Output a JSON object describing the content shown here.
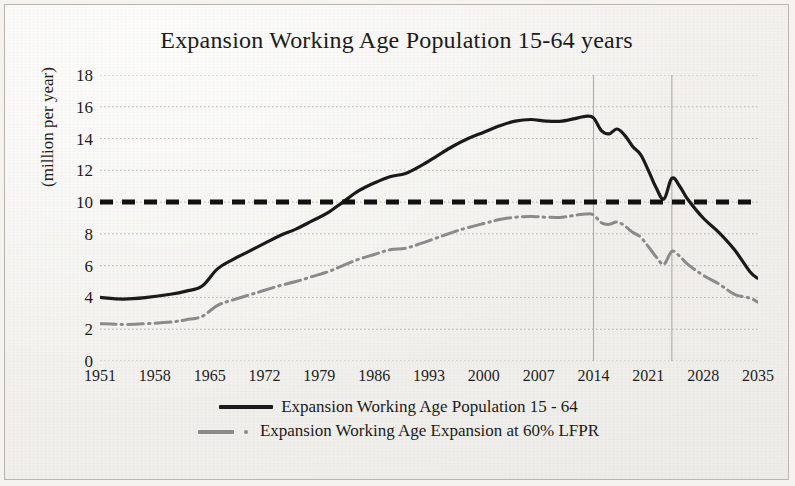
{
  "chart_data": {
    "type": "line",
    "title": "Expansion Working Age Population 15-64 years",
    "xlabel": "",
    "ylabel": "(million per year)",
    "ylim": [
      0,
      18
    ],
    "xlim": [
      1951,
      2035
    ],
    "yticks": [
      18,
      16,
      14,
      12,
      10,
      8,
      6,
      4,
      2,
      0
    ],
    "xticks": [
      1951,
      1958,
      1965,
      1972,
      1979,
      1986,
      1993,
      2000,
      2007,
      2014,
      2021,
      2028,
      2035
    ],
    "grid": "horizontal dotted, two vertical lines at 2014 and 2024",
    "legend_position": "below-plot-center",
    "reference_line": {
      "label": "10 million per year threshold",
      "value": 10,
      "style": "thick black dashed"
    },
    "vertical_gridlines": [
      2014,
      2024
    ],
    "series": [
      {
        "name": "Expansion Working Age Population 15 - 64",
        "color": "#1a1a1a",
        "style": "solid",
        "x": [
          1951,
          1954,
          1957,
          1960,
          1962,
          1964,
          1966,
          1968,
          1970,
          1972,
          1974,
          1976,
          1978,
          1980,
          1982,
          1984,
          1986,
          1988,
          1990,
          1992,
          1994,
          1996,
          1998,
          2000,
          2002,
          2004,
          2006,
          2008,
          2010,
          2012,
          2013,
          2014,
          2015,
          2016,
          2017,
          2018,
          2019,
          2020,
          2021,
          2022,
          2023,
          2024,
          2025,
          2026,
          2028,
          2030,
          2032,
          2034,
          2035
        ],
        "y": [
          4.0,
          3.9,
          4.0,
          4.2,
          4.4,
          4.7,
          5.8,
          6.4,
          6.9,
          7.4,
          7.9,
          8.3,
          8.8,
          9.3,
          10.0,
          10.7,
          11.2,
          11.6,
          11.8,
          12.3,
          12.9,
          13.5,
          14.0,
          14.4,
          14.8,
          15.1,
          15.2,
          15.1,
          15.1,
          15.3,
          15.4,
          15.3,
          14.5,
          14.3,
          14.6,
          14.2,
          13.5,
          13.0,
          12.0,
          10.9,
          10.2,
          11.5,
          11.0,
          10.2,
          9.0,
          8.1,
          7.0,
          5.6,
          5.2
        ]
      },
      {
        "name": "Expansion Working Age Expansion at 60% LFPR",
        "color": "#8a8a8a",
        "style": "dash-dot",
        "x": [
          1951,
          1954,
          1957,
          1960,
          1962,
          1964,
          1966,
          1968,
          1970,
          1972,
          1974,
          1976,
          1978,
          1980,
          1982,
          1984,
          1986,
          1988,
          1990,
          1992,
          1994,
          1996,
          1998,
          2000,
          2002,
          2004,
          2006,
          2008,
          2010,
          2012,
          2013,
          2014,
          2015,
          2016,
          2017,
          2018,
          2019,
          2020,
          2021,
          2022,
          2023,
          2024,
          2025,
          2026,
          2028,
          2030,
          2032,
          2034,
          2035
        ],
        "y": [
          2.35,
          2.3,
          2.35,
          2.45,
          2.6,
          2.8,
          3.5,
          3.85,
          4.15,
          4.45,
          4.75,
          5.0,
          5.3,
          5.6,
          6.0,
          6.4,
          6.7,
          7.0,
          7.1,
          7.4,
          7.75,
          8.1,
          8.4,
          8.65,
          8.9,
          9.05,
          9.1,
          9.05,
          9.05,
          9.2,
          9.25,
          9.2,
          8.7,
          8.6,
          8.75,
          8.5,
          8.1,
          7.8,
          7.2,
          6.55,
          6.1,
          6.9,
          6.6,
          6.1,
          5.4,
          4.85,
          4.2,
          3.95,
          3.7
        ]
      }
    ]
  },
  "legend": [
    {
      "label": "Expansion Working Age Population 15 - 64",
      "key": "solid"
    },
    {
      "label": "Expansion Working Age Expansion at 60% LFPR",
      "key": "dashdot"
    }
  ]
}
